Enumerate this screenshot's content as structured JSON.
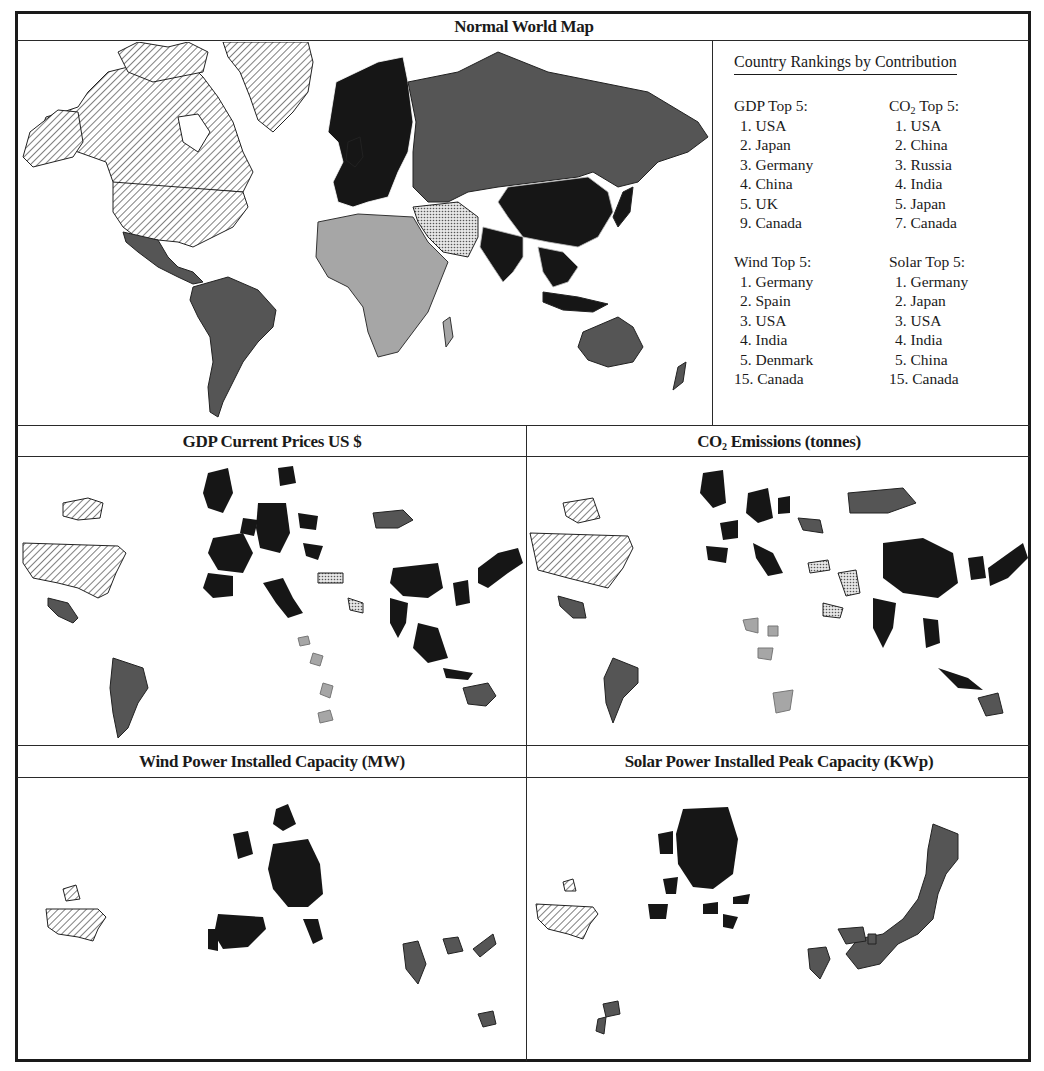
{
  "figure": {
    "panels": [
      {
        "id": "normal",
        "title": "Normal World Map"
      },
      {
        "id": "gdp",
        "title": "GDP Current Prices US $"
      },
      {
        "id": "co2",
        "title_prefix": "CO",
        "title_sub": "2",
        "title_suffix": " Emissions (tonnes)"
      },
      {
        "id": "wind",
        "title": "Wind Power Installed Capacity (MW)"
      },
      {
        "id": "solar",
        "title": "Solar Power Installed Peak Capacity (KWp)"
      }
    ],
    "colors": {
      "border": "#1a1a1a",
      "dark_fill": "#161616",
      "mid_fill": "#555555",
      "light_fill": "#a6a6a6",
      "hatch": "#2a2a2a",
      "background": "#ffffff"
    }
  },
  "legend": {
    "heading": "Country Rankings by Contribution",
    "groups": [
      {
        "title": "GDP Top 5:",
        "items": [
          "1. USA",
          "2. Japan",
          "3. Germany",
          "4. China",
          "5. UK",
          "9. Canada"
        ]
      },
      {
        "title_prefix": "CO",
        "title_sub": "2",
        "title_suffix": " Top 5:",
        "items": [
          "1. USA",
          "2. China",
          "3. Russia",
          "4. India",
          "5. Japan",
          "7. Canada"
        ]
      },
      {
        "title": "Wind Top 5:",
        "items": [
          "1. Germany",
          "2. Spain",
          "3. USA",
          "4. India",
          "5. Denmark",
          "15. Canada"
        ]
      },
      {
        "title": "Solar Top 5:",
        "items": [
          "1. Germany",
          "2. Japan",
          "3. USA",
          "4. India",
          "5. China",
          "15. Canada"
        ]
      }
    ]
  }
}
